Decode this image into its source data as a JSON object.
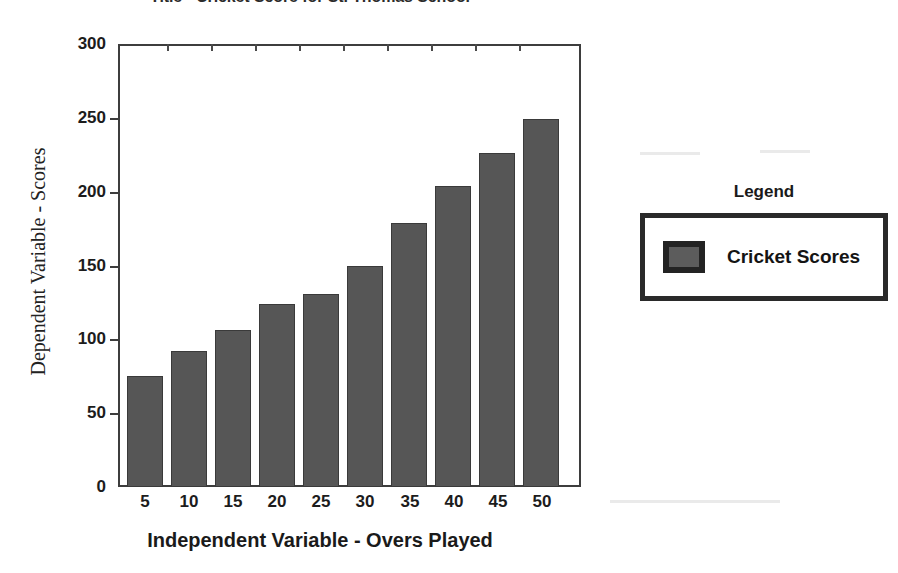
{
  "chart_data": {
    "type": "bar",
    "title": "Title - Cricket Score for St. Thomas School",
    "xlabel": "Independent Variable - Overs Played",
    "ylabel": "Dependent Variable - Scores",
    "categories": [
      "5",
      "10",
      "15",
      "20",
      "25",
      "30",
      "35",
      "40",
      "45",
      "50"
    ],
    "values": [
      75,
      92,
      106,
      124,
      131,
      150,
      179,
      204,
      226,
      249
    ],
    "series": [
      {
        "name": "Cricket Scores",
        "values": [
          75,
          92,
          106,
          124,
          131,
          150,
          179,
          204,
          226,
          249
        ],
        "color": "#565656"
      }
    ],
    "ylim": [
      0,
      300
    ],
    "yticks": [
      "0",
      "50",
      "100",
      "150",
      "200",
      "250",
      "300"
    ],
    "ytick_values": [
      0,
      50,
      100,
      150,
      200,
      250,
      300
    ],
    "xticks": [
      "5",
      "10",
      "15",
      "20",
      "25",
      "30",
      "35",
      "40",
      "45",
      "50"
    ],
    "grid": false,
    "legend_position": "right"
  },
  "legend": {
    "heading": "Legend",
    "entries": [
      {
        "label": "Cricket Scores",
        "swatch_color": "#5c5c5c"
      }
    ]
  },
  "colors": {
    "bar_fill": "#565656",
    "bar_stroke": "#3a3a3a",
    "axis": "#3d3d3d",
    "text": "#1a1a1a",
    "background": "#ffffff"
  }
}
